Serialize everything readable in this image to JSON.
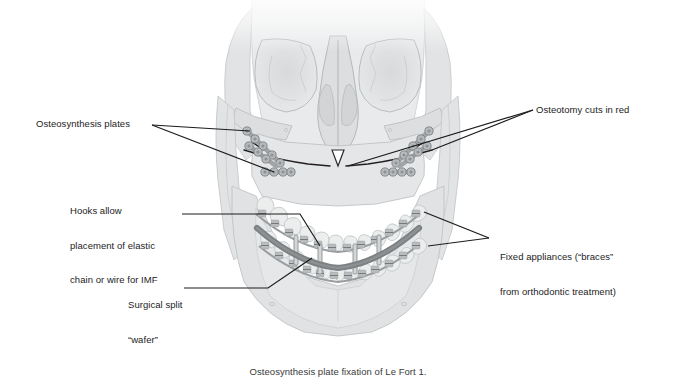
{
  "figure": {
    "title": "Osteosynthesis plate fixation of Le Fort 1.",
    "colors": {
      "bone_fill": "#e3e4e4",
      "bone_fill_light": "#eeeff0",
      "bone_outline": "#b8bcbe",
      "plate_gray": "#9b9fa1",
      "screw_gray": "#8a8e90",
      "osteotomy_line": "#231f20",
      "archwire": "#8e9294",
      "wafer_gray": "#7e8284",
      "leader_line": "#1c1c1c",
      "text": "#1c1c1c",
      "caption_text": "#3a3a3a",
      "background": "#ffffff"
    }
  },
  "annotations": {
    "osteosynthesis_plates": {
      "label": "Osteosynthesis plates"
    },
    "hooks_imf": {
      "line1": "Hooks allow",
      "line2": "placement of elastic",
      "line3": "chain or wire for IMF"
    },
    "surgical_wafer": {
      "line1": "Surgical split",
      "line2": "“wafer”"
    },
    "osteotomy_cuts": {
      "label": "Osteotomy cuts in red"
    },
    "fixed_appliances": {
      "line1": "Fixed appliances (“braces”",
      "line2": "from orthodontic treatment)"
    }
  },
  "caption": {
    "text": "Osteosynthesis plate fixation of Le Fort 1."
  }
}
